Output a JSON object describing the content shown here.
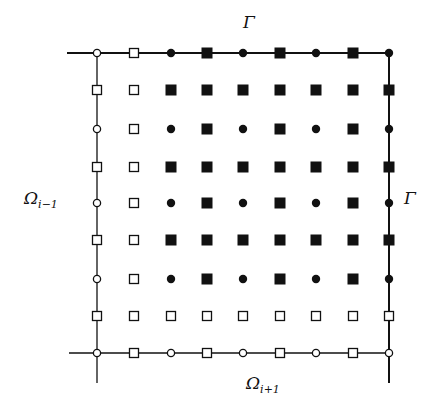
{
  "diagram": {
    "grid": {
      "cols_x": [
        97,
        134,
        171,
        207,
        243,
        280,
        316,
        353,
        389
      ],
      "rows_y": [
        53,
        90,
        129,
        167,
        203,
        240,
        279,
        316,
        353
      ],
      "legend_symbols": {
        "o": "open-circle",
        "s": "open-square",
        "d": "filled-circle",
        "S": "filled-square"
      },
      "rows": [
        [
          "o",
          "s",
          "d",
          "S",
          "d",
          "S",
          "d",
          "S",
          "d"
        ],
        [
          "s",
          "s",
          "S",
          "S",
          "S",
          "S",
          "S",
          "S",
          "S"
        ],
        [
          "o",
          "s",
          "d",
          "S",
          "d",
          "S",
          "d",
          "S",
          "d"
        ],
        [
          "s",
          "s",
          "S",
          "S",
          "S",
          "S",
          "S",
          "S",
          "S"
        ],
        [
          "o",
          "s",
          "d",
          "S",
          "d",
          "S",
          "d",
          "S",
          "d"
        ],
        [
          "s",
          "s",
          "S",
          "S",
          "S",
          "S",
          "S",
          "S",
          "S"
        ],
        [
          "o",
          "s",
          "d",
          "S",
          "d",
          "S",
          "d",
          "S",
          "d"
        ],
        [
          "s",
          "s",
          "s",
          "s",
          "s",
          "s",
          "s",
          "s",
          "s"
        ],
        [
          "o",
          "s",
          "o",
          "s",
          "o",
          "s",
          "o",
          "s",
          "o"
        ]
      ]
    },
    "lines": {
      "top": {
        "x1": 67,
        "x2": 389,
        "y": 53
      },
      "bottom": {
        "x1": 69,
        "x2": 389,
        "y": 353
      },
      "left": {
        "x": 97,
        "y1": 53,
        "y2": 383
      },
      "right": {
        "x": 389,
        "y1": 53,
        "y2": 383
      }
    },
    "labels": {
      "gamma_top": "Γ",
      "gamma_right": "Γ",
      "omega_left_main": "Ω",
      "omega_left_sub": "i−1",
      "omega_bottom_main": "Ω",
      "omega_bottom_sub": "i+1"
    },
    "colors": {
      "ink": "#111111",
      "background": "#ffffff"
    }
  }
}
